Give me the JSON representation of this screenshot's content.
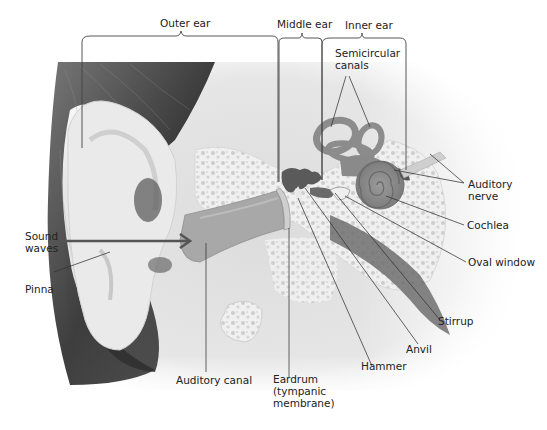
{
  "diagram": {
    "type": "anatomical-illustration",
    "sections": [
      {
        "id": "outer",
        "label": "Outer ear"
      },
      {
        "id": "middle",
        "label": "Middle ear"
      },
      {
        "id": "inner",
        "label": "Inner ear"
      }
    ],
    "labels": {
      "semicircular_canals": "Semicircular\ncanals",
      "auditory_nerve": "Auditory\nnerve",
      "cochlea": "Cochlea",
      "oval_window": "Oval window",
      "stirrup": "Stirrup",
      "anvil": "Anvil",
      "hammer": "Hammer",
      "eardrum": "Eardrum\n(tympanic\nmembrane)",
      "auditory_canal": "Auditory canal",
      "sound_waves": "Sound\nwaves",
      "pinna": "Pinna"
    },
    "colors": {
      "background": "#ffffff",
      "skin": "#e4e4e4",
      "skin_light": "#eeeeee",
      "hair_dark": "#3a3a3a",
      "bone": "#f2f2f2",
      "bone_spot": "#cfcfcf",
      "canal": "#9a9a9a",
      "organ": "#858585",
      "ossicle": "#5a5a5a",
      "leader": "#333333",
      "text": "#222222"
    }
  }
}
